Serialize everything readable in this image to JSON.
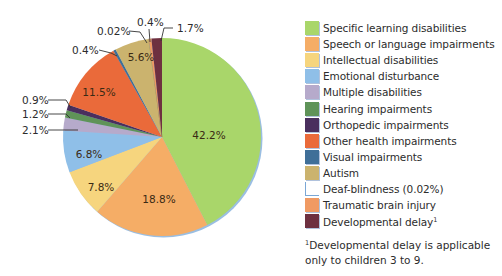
{
  "chart_data": {
    "type": "pie",
    "title": "",
    "start_angle_deg": 0,
    "direction": "clockwise",
    "unit": "%",
    "slices": [
      {
        "label": "Specific learning disabilities",
        "value": 42.2,
        "display": "42.2%",
        "color": "#a9d66a"
      },
      {
        "label": "Speech or language impairments",
        "value": 18.8,
        "display": "18.8%",
        "color": "#f5ad66"
      },
      {
        "label": "Intellectual disabilities",
        "value": 7.8,
        "display": "7.8%",
        "color": "#f6d57e"
      },
      {
        "label": "Emotional disturbance",
        "value": 6.8,
        "display": "6.8%",
        "color": "#8fbfe8"
      },
      {
        "label": "Multiple disabilities",
        "value": 2.1,
        "display": "2.1%",
        "color": "#b6aacb"
      },
      {
        "label": "Hearing impairments",
        "value": 1.2,
        "display": "1.2%",
        "color": "#5f9358"
      },
      {
        "label": "Orthopedic impairments",
        "value": 0.9,
        "display": "0.9%",
        "color": "#4a2f5e"
      },
      {
        "label": "Other health impairments",
        "value": 11.5,
        "display": "11.5%",
        "color": "#ea6a3a"
      },
      {
        "label": "Visual impairments",
        "value": 0.4,
        "display": "0.4%",
        "color": "#3f6f98"
      },
      {
        "label": "Autism",
        "value": 5.6,
        "display": "5.6%",
        "color": "#cbb36e"
      },
      {
        "label": "Deaf-blindness",
        "value": 0.02,
        "display": "0.02%",
        "color": "#ffffff"
      },
      {
        "label": "Traumatic brain injury",
        "value": 0.4,
        "display": "0.4%",
        "color": "#f09a63"
      },
      {
        "label": "Developmental delay",
        "value": 1.7,
        "display": "1.7%",
        "color": "#6e3040"
      }
    ],
    "legend_position": "right",
    "grid": false
  },
  "pie_labels": {
    "inside": [
      {
        "slice": 0,
        "text": "42.2%",
        "x": 209,
        "y": 139
      },
      {
        "slice": 1,
        "text": "18.8%",
        "x": 159,
        "y": 203
      },
      {
        "slice": 2,
        "text": "7.8%",
        "x": 101,
        "y": 191
      },
      {
        "slice": 3,
        "text": "6.8%",
        "x": 89,
        "y": 158
      },
      {
        "slice": 7,
        "text": "11.5%",
        "x": 99,
        "y": 96
      },
      {
        "slice": 9,
        "text": "5.6%",
        "x": 141,
        "y": 61
      }
    ],
    "outside": [
      {
        "slice": 6,
        "text": "0.9%",
        "x": 22,
        "y": 104,
        "line": [
          [
            48,
            100
          ],
          [
            66,
            100
          ],
          [
            71,
            108
          ]
        ]
      },
      {
        "slice": 5,
        "text": "1.2%",
        "x": 22,
        "y": 118,
        "line": [
          [
            48,
            114
          ],
          [
            66,
            114
          ],
          [
            70,
            118
          ]
        ]
      },
      {
        "slice": 4,
        "text": "2.1%",
        "x": 22,
        "y": 134,
        "line": [
          [
            48,
            130
          ],
          [
            78,
            130
          ]
        ]
      },
      {
        "slice": 8,
        "text": "0.4%",
        "x": 72,
        "y": 54,
        "line": [
          [
            99,
            50
          ],
          [
            111,
            53
          ],
          [
            117,
            56
          ]
        ]
      },
      {
        "slice": 10,
        "text": "0.02%",
        "x": 97,
        "y": 35,
        "line": [
          [
            129,
            31
          ],
          [
            140,
            32
          ],
          [
            147,
            43
          ]
        ]
      },
      {
        "slice": 11,
        "text": "0.4%",
        "x": 137,
        "y": 26,
        "line": [
          [
            149,
            29
          ],
          [
            150,
            42
          ]
        ]
      },
      {
        "slice": 12,
        "text": "1.7%",
        "x": 177,
        "y": 32,
        "line": [
          [
            173,
            28
          ],
          [
            164,
            28
          ],
          [
            161,
            41
          ]
        ]
      }
    ]
  },
  "legend": {
    "items": [
      {
        "label": "Specific learning disabilities",
        "color": "#a9d66a"
      },
      {
        "label": "Speech or language impairments",
        "color": "#f5ad66"
      },
      {
        "label": "Intellectual disabilities",
        "color": "#f6d57e"
      },
      {
        "label": "Emotional disturbance",
        "color": "#8fbfe8"
      },
      {
        "label": "Multiple disabilities",
        "color": "#b6aacb"
      },
      {
        "label": "Hearing impairments",
        "color": "#5f9358"
      },
      {
        "label": "Orthopedic impairments",
        "color": "#4a2f5e"
      },
      {
        "label": "Other health impairments",
        "color": "#ea6a3a"
      },
      {
        "label": "Visual impairments",
        "color": "#3f6f98"
      },
      {
        "label": "Autism",
        "color": "#cbb36e"
      },
      {
        "label": "Deaf-blindness (0.02%)",
        "color": "#ffffff",
        "outline": true
      },
      {
        "label": "Traumatic brain injury",
        "color": "#f09a63"
      },
      {
        "label": "Developmental delay",
        "color": "#6e3040",
        "footnote_mark": "1"
      }
    ]
  },
  "footnote": {
    "mark": "1",
    "text": "Developmental delay is applicable only to children 3 to 9."
  }
}
